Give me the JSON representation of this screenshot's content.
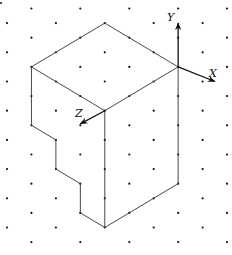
{
  "diagram": {
    "type": "isometric-dot-grid-solid",
    "background": "#ffffff",
    "grid": {
      "origin_x": 7,
      "origin_y": 8.5,
      "col_spacing": 24.45,
      "row_spacing": 14.6,
      "cols": 10,
      "rows": 17,
      "pattern": "dots where (col+row) is odd",
      "dot_color": "#111111"
    },
    "axes": [
      {
        "name": "Y",
        "label": "Y",
        "from": [
          7,
          4
        ],
        "to": [
          7,
          1
        ],
        "label_pos": [
          171,
          19
        ]
      },
      {
        "name": "X",
        "label": "X",
        "from": [
          7,
          4
        ],
        "to": [
          8.5,
          5
        ],
        "label_pos": [
          212,
          76
        ]
      },
      {
        "name": "Z",
        "label": "Z",
        "from": [
          4,
          7
        ],
        "to": [
          3,
          7.9
        ],
        "label_pos": [
          76,
          116
        ]
      }
    ],
    "edges": [
      [
        [
          4,
          1
        ],
        [
          1,
          4
        ]
      ],
      [
        [
          4,
          1
        ],
        [
          7,
          4
        ]
      ],
      [
        [
          1,
          4
        ],
        [
          4,
          7
        ]
      ],
      [
        [
          7,
          4
        ],
        [
          4,
          7
        ]
      ],
      [
        [
          4,
          7
        ],
        [
          4,
          15
        ]
      ],
      [
        [
          7,
          4
        ],
        [
          7,
          12
        ]
      ],
      [
        [
          7,
          12
        ],
        [
          4,
          15
        ]
      ],
      [
        [
          1,
          4
        ],
        [
          1,
          8
        ]
      ],
      [
        [
          1,
          8
        ],
        [
          2,
          9
        ]
      ],
      [
        [
          2,
          9
        ],
        [
          2,
          11
        ]
      ],
      [
        [
          2,
          11
        ],
        [
          3,
          12
        ]
      ],
      [
        [
          3,
          12
        ],
        [
          3,
          14
        ]
      ],
      [
        [
          3,
          14
        ],
        [
          4,
          15
        ]
      ]
    ],
    "labels": {
      "x": "X",
      "y": "Y",
      "z": "Z"
    }
  }
}
